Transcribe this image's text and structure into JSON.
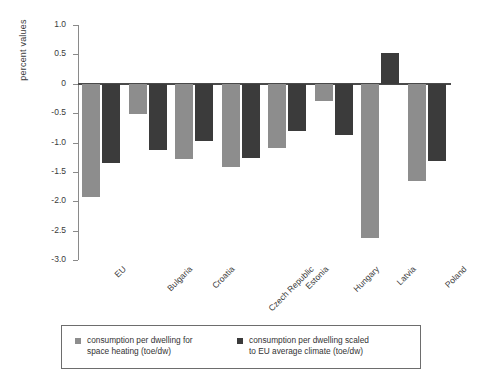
{
  "chart_data": {
    "type": "bar",
    "title": "",
    "subtitle": "",
    "xlabel": "",
    "ylabel": "percent values",
    "categories": [
      "EU",
      "Bulgaria",
      "Croatia",
      "Czech Republic",
      "Estonia",
      "Hungary",
      "Latvia",
      "Poland"
    ],
    "series": [
      {
        "name": "consumption per dwelling for space heating (toe/dw)",
        "color": "#8d8d8d",
        "values": [
          -1.93,
          -0.51,
          -1.28,
          -1.42,
          -1.1,
          -0.29,
          -2.63,
          -1.66
        ]
      },
      {
        "name": "consumption per dwelling scaled to EU average climate (toe/dw)",
        "color": "#3b3b3b",
        "values": [
          -1.35,
          -1.13,
          -0.97,
          -1.27,
          -0.8,
          -0.88,
          0.53,
          -1.32
        ]
      }
    ],
    "ylim": [
      -3.0,
      1.0
    ],
    "yticks": [
      1.0,
      0.5,
      0,
      -0.5,
      -1.0,
      -1.5,
      -2.0,
      -2.5,
      -3.0
    ],
    "ytick_labels": [
      "1.0",
      "0.5",
      "0",
      "-0.5",
      "-1.0",
      "-1.5",
      "-2.0",
      "-2.5",
      "-3.0"
    ],
    "grid": false,
    "legend_position": "bottom",
    "zero_line": true
  },
  "legend": {
    "entries": [
      {
        "line1": "consumption per dwelling for",
        "line2": "space heating (toe/dw)",
        "color": "#8d8d8d"
      },
      {
        "line1": "consumption per dwelling scaled",
        "line2": "to EU average climate (toe/dw)",
        "color": "#3b3b3b"
      }
    ]
  }
}
